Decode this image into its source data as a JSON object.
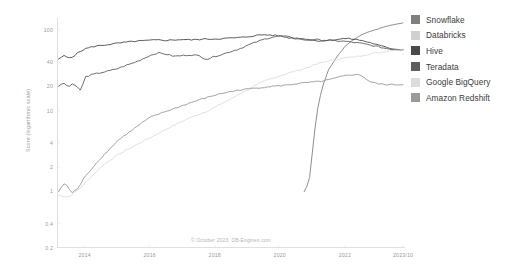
{
  "chart_data": {
    "type": "line",
    "title": "",
    "subtitle": "",
    "xlabel": "",
    "ylabel": "Score (logarithmic scale)",
    "yscale": "log",
    "ylim": [
      0.2,
      140
    ],
    "ytick_labels": [
      "100",
      "40",
      "20",
      "10",
      "4",
      "2",
      "1",
      "0.4",
      "0.2"
    ],
    "ytick_values": [
      100,
      40,
      20,
      10,
      4,
      2,
      1,
      0.4,
      0.2
    ],
    "xtick_labels": [
      "2014",
      "2016",
      "2018",
      "2020",
      "2022",
      "2023/10"
    ],
    "xtick_values": [
      2014,
      2016,
      2018,
      2020,
      2022,
      2023.79
    ],
    "xlim": [
      2013.15,
      2023.85
    ],
    "grid": false,
    "legend_position": "right",
    "annotation": "© October 2023, DB-Engines.com",
    "series": [
      {
        "name": "Snowflake",
        "color": "#808080",
        "x": [
          2013.2,
          2013.5,
          2013.8,
          2014.0,
          2014.25,
          2014.5,
          2014.75,
          2015.0,
          2015.25,
          2015.5,
          2015.75,
          2016.0,
          2016.25,
          2016.5,
          2016.75,
          2017.0,
          2017.25,
          2017.5,
          2017.75,
          2018.0,
          2018.25,
          2018.5,
          2018.75,
          2019.0,
          2019.25,
          2019.5,
          2019.75,
          2020.0,
          2020.25,
          2020.5,
          2020.75,
          2020.9,
          2021.0,
          2021.1,
          2021.2,
          2021.35,
          2021.5,
          2021.75,
          2022.0,
          2022.25,
          2022.5,
          2022.75,
          2023.0,
          2023.25,
          2023.5,
          2023.79
        ],
        "y": [
          null,
          null,
          null,
          null,
          null,
          null,
          null,
          null,
          null,
          null,
          null,
          null,
          null,
          null,
          null,
          null,
          null,
          null,
          null,
          null,
          null,
          null,
          null,
          null,
          null,
          null,
          null,
          null,
          null,
          null,
          1.0,
          1.3,
          3.0,
          7.0,
          13.0,
          22.0,
          32.0,
          46.0,
          62.0,
          75.0,
          86.0,
          95.0,
          102.0,
          110.0,
          116.0,
          122.0
        ]
      },
      {
        "name": "Databricks",
        "color": "#d0d0d0",
        "x": [
          2013.2,
          2013.5,
          2013.8,
          2014.0,
          2014.25,
          2014.5,
          2014.75,
          2015.0,
          2015.25,
          2015.5,
          2015.75,
          2016.0,
          2016.25,
          2016.5,
          2016.75,
          2017.0,
          2017.25,
          2017.5,
          2017.75,
          2018.0,
          2018.25,
          2018.5,
          2018.75,
          2019.0,
          2019.25,
          2019.5,
          2019.75,
          2020.0,
          2020.25,
          2020.5,
          2020.75,
          2021.0,
          2021.25,
          2021.5,
          2021.75,
          2022.0,
          2022.25,
          2022.5,
          2022.75,
          2023.0,
          2023.25,
          2023.5,
          2023.79
        ],
        "y": [
          null,
          null,
          null,
          null,
          null,
          null,
          null,
          null,
          null,
          null,
          null,
          null,
          null,
          null,
          null,
          null,
          null,
          null,
          null,
          null,
          null,
          null,
          null,
          null,
          null,
          null,
          null,
          null,
          null,
          null,
          null,
          null,
          null,
          null,
          null,
          null,
          null,
          null,
          null,
          null,
          null,
          null,
          50.0
        ]
      },
      {
        "name": "Hive",
        "color": "#4a4a4a",
        "x": [
          2013.2,
          2013.35,
          2013.5,
          2013.65,
          2013.8,
          2014.0,
          2014.25,
          2014.5,
          2014.75,
          2015.0,
          2015.25,
          2015.5,
          2015.75,
          2016.0,
          2016.25,
          2016.5,
          2016.75,
          2017.0,
          2017.25,
          2017.5,
          2017.75,
          2018.0,
          2018.25,
          2018.5,
          2018.75,
          2019.0,
          2019.25,
          2019.5,
          2019.75,
          2020.0,
          2020.25,
          2020.5,
          2020.75,
          2021.0,
          2021.25,
          2021.5,
          2021.75,
          2022.0,
          2022.25,
          2022.5,
          2022.75,
          2023.0,
          2023.25,
          2023.5,
          2023.79
        ],
        "y": [
          43.0,
          48.0,
          45.0,
          47.0,
          52.0,
          58.0,
          62.0,
          64.0,
          66.0,
          68.0,
          70.0,
          72.0,
          73.0,
          74.0,
          75.0,
          74.0,
          75.0,
          76.0,
          75.0,
          76.0,
          77.0,
          77.0,
          78.0,
          79.0,
          80.0,
          82.0,
          85.0,
          87.0,
          86.0,
          84.0,
          80.0,
          78.0,
          76.0,
          74.0,
          73.0,
          74.0,
          76.0,
          78.0,
          77.0,
          74.0,
          70.0,
          65.0,
          61.0,
          58.0,
          57.0
        ]
      },
      {
        "name": "Teradata",
        "color": "#5e5e5e",
        "x": [
          2013.2,
          2013.35,
          2013.5,
          2013.65,
          2013.8,
          2013.9,
          2014.0,
          2014.25,
          2014.5,
          2014.75,
          2015.0,
          2015.25,
          2015.5,
          2015.75,
          2016.0,
          2016.25,
          2016.5,
          2016.75,
          2017.0,
          2017.25,
          2017.5,
          2017.75,
          2018.0,
          2018.25,
          2018.5,
          2018.75,
          2019.0,
          2019.25,
          2019.5,
          2019.75,
          2020.0,
          2020.25,
          2020.5,
          2020.75,
          2021.0,
          2021.25,
          2021.5,
          2021.75,
          2022.0,
          2022.25,
          2022.5,
          2022.75,
          2023.0,
          2023.25,
          2023.5,
          2023.79
        ],
        "y": [
          20.0,
          22.5,
          19.5,
          22.0,
          19.0,
          17.5,
          26.0,
          28.0,
          29.5,
          31.0,
          33.0,
          36.0,
          39.0,
          43.0,
          48.0,
          52.0,
          50.0,
          47.0,
          48.0,
          49.0,
          48.0,
          43.0,
          47.0,
          50.0,
          54.0,
          58.0,
          64.0,
          70.0,
          76.0,
          81.0,
          84.0,
          82.0,
          79.0,
          77.0,
          76.0,
          75.0,
          74.0,
          73.0,
          72.0,
          70.0,
          68.0,
          65.0,
          62.0,
          59.0,
          57.0,
          57.0
        ]
      },
      {
        "name": "Google BigQuery",
        "color": "#dcdcdc",
        "x": [
          2013.2,
          2013.5,
          2013.8,
          2014.0,
          2014.25,
          2014.5,
          2014.75,
          2015.0,
          2015.25,
          2015.5,
          2015.75,
          2016.0,
          2016.25,
          2016.5,
          2016.75,
          2017.0,
          2017.25,
          2017.5,
          2017.75,
          2018.0,
          2018.25,
          2018.5,
          2018.75,
          2019.0,
          2019.25,
          2019.5,
          2019.75,
          2020.0,
          2020.25,
          2020.5,
          2020.75,
          2021.0,
          2021.25,
          2021.5,
          2021.75,
          2022.0,
          2022.25,
          2022.5,
          2022.75,
          2023.0,
          2023.25,
          2023.5,
          2023.79
        ],
        "y": [
          0.9,
          0.85,
          1.05,
          1.25,
          1.6,
          2.0,
          2.4,
          2.8,
          3.2,
          3.6,
          4.1,
          4.6,
          5.2,
          5.9,
          6.6,
          7.4,
          8.2,
          9.0,
          9.8,
          11.0,
          12.5,
          14.0,
          16.0,
          18.0,
          20.5,
          23.0,
          25.0,
          27.0,
          29.0,
          31.0,
          33.0,
          36.0,
          39.0,
          41.0,
          43.0,
          45.0,
          46.0,
          48.0,
          50.0,
          52.0,
          54.0,
          56.0,
          57.0
        ]
      },
      {
        "name": "Amazon Redshift",
        "color": "#9a9a9a",
        "x": [
          2013.2,
          2013.4,
          2013.6,
          2013.8,
          2014.0,
          2014.25,
          2014.5,
          2014.75,
          2015.0,
          2015.25,
          2015.5,
          2015.75,
          2016.0,
          2016.25,
          2016.5,
          2016.75,
          2017.0,
          2017.25,
          2017.5,
          2017.75,
          2018.0,
          2018.25,
          2018.5,
          2018.75,
          2019.0,
          2019.25,
          2019.5,
          2019.75,
          2020.0,
          2020.25,
          2020.5,
          2020.75,
          2021.0,
          2021.25,
          2021.5,
          2021.75,
          2022.0,
          2022.25,
          2022.5,
          2022.75,
          2023.0,
          2023.25,
          2023.5,
          2023.79
        ],
        "y": [
          1.0,
          1.3,
          0.95,
          1.1,
          1.5,
          2.0,
          2.6,
          3.3,
          4.2,
          5.0,
          5.9,
          7.0,
          8.2,
          9.0,
          9.8,
          10.6,
          11.5,
          12.5,
          13.5,
          14.5,
          15.5,
          16.5,
          17.2,
          18.0,
          18.5,
          19.0,
          19.5,
          20.0,
          20.3,
          20.8,
          21.5,
          22.0,
          22.5,
          23.0,
          24.0,
          25.5,
          27.0,
          28.0,
          27.5,
          23.0,
          21.5,
          21.0,
          21.0,
          21.0
        ]
      }
    ]
  },
  "legend": {
    "items": [
      {
        "label": "Snowflake",
        "color": "#808080"
      },
      {
        "label": "Databricks",
        "color": "#d0d0d0"
      },
      {
        "label": "Hive",
        "color": "#4a4a4a"
      },
      {
        "label": "Teradata",
        "color": "#5e5e5e"
      },
      {
        "label": "Google BigQuery",
        "color": "#dcdcdc"
      },
      {
        "label": "Amazon Redshift",
        "color": "#9a9a9a"
      }
    ]
  },
  "axes": {
    "y_label": "Score (logarithmic scale)",
    "y_ticks": [
      "100",
      "40",
      "20",
      "10",
      "4",
      "2",
      "1",
      "0.4",
      "0.2"
    ],
    "x_ticks": [
      "2014",
      "2016",
      "2018",
      "2020",
      "2022",
      "2023/10"
    ]
  },
  "footer": {
    "copyright": "© October 2023, DB-Engines.com"
  }
}
